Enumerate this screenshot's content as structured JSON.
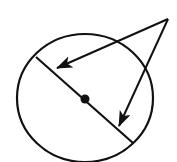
{
  "diagram": {
    "type": "geometry",
    "colors": {
      "stroke": "#111111",
      "background": "#ffffff"
    },
    "circle": {
      "cx": 85,
      "cy": 98,
      "rx": 68,
      "ry": 64
    },
    "center_point": {
      "x": 85,
      "y": 99,
      "r": 4.5
    },
    "diameter": {
      "x1": 36,
      "y1": 57,
      "x2": 133,
      "y2": 143
    },
    "external_point": {
      "x": 168,
      "y": 19
    },
    "arrows": [
      {
        "name": "arrow-to-diameter-upper",
        "from": [
          168,
          19
        ],
        "to": [
          57,
          68
        ]
      },
      {
        "name": "arrow-to-diameter-lower",
        "from": [
          168,
          19
        ],
        "to": [
          119,
          126
        ]
      }
    ],
    "labels": []
  }
}
